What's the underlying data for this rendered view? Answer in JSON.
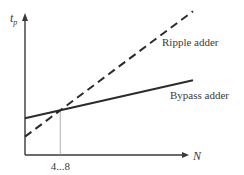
{
  "chart_data": {
    "type": "line",
    "title": "",
    "xlabel": "N",
    "ylabel": "t",
    "ylabel_subscript": "p",
    "x_tick_label": "4...8",
    "grid": false,
    "legend": "inline labels (right)",
    "xlim": [
      0,
      1
    ],
    "ylim": [
      0,
      1
    ],
    "crossover_x": 0.21,
    "series": [
      {
        "name": "Ripple adder",
        "style": "dashed",
        "x": [
          0,
          1
        ],
        "y": [
          0.13,
          1.02
        ]
      },
      {
        "name": "Bypass adder",
        "style": "solid",
        "x": [
          0,
          1
        ],
        "y": [
          0.26,
          0.53
        ]
      }
    ]
  },
  "colors": {
    "line": "#2b2b2b",
    "axis": "#3a3a3a",
    "guide": "#9a9a9a",
    "text": "#3a3a3a"
  }
}
